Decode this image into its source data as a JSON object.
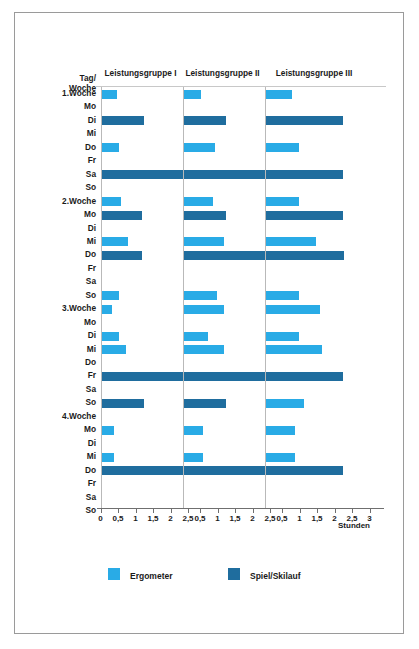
{
  "corner_label": "Tag/\nWoche",
  "unit_label": "Stunden",
  "panels": [
    {
      "title": "Leistungsgruppe I",
      "ticks": [
        "0",
        "0,5",
        "1",
        "1,5",
        "2",
        "2,5"
      ],
      "tick_values": [
        0,
        0.5,
        1,
        1.5,
        2,
        2.5
      ]
    },
    {
      "title": "Leistungsgruppe II",
      "ticks": [
        "0,5",
        "1",
        "1,5",
        "2",
        "2,5"
      ],
      "tick_values": [
        0.5,
        1,
        1.5,
        2,
        2.5
      ]
    },
    {
      "title": "Leistungsgruppe III",
      "ticks": [
        "0,5",
        "1",
        "1,5",
        "2",
        "2,5",
        "3"
      ],
      "tick_values": [
        0.5,
        1,
        1.5,
        2,
        2.5,
        3
      ]
    }
  ],
  "legend": [
    {
      "label": "Ergometer",
      "color": "#29abe6",
      "series": "ergometer"
    },
    {
      "label": "Spiel/Skilauf",
      "color": "#1f6d9e",
      "series": "spiel"
    }
  ],
  "rows": [
    {
      "label": "1.Woche",
      "type": "week"
    },
    {
      "label": "Mo",
      "type": "day"
    },
    {
      "label": "Di",
      "type": "day"
    },
    {
      "label": "Mi",
      "type": "day"
    },
    {
      "label": "Do",
      "type": "day"
    },
    {
      "label": "Fr",
      "type": "day"
    },
    {
      "label": "Sa",
      "type": "day"
    },
    {
      "label": "So",
      "type": "day"
    },
    {
      "label": "2.Woche",
      "type": "week"
    },
    {
      "label": "Mo",
      "type": "day"
    },
    {
      "label": "Di",
      "type": "day"
    },
    {
      "label": "Mi",
      "type": "day"
    },
    {
      "label": "Do",
      "type": "day"
    },
    {
      "label": "Fr",
      "type": "day"
    },
    {
      "label": "Sa",
      "type": "day"
    },
    {
      "label": "So",
      "type": "day"
    },
    {
      "label": "3.Woche",
      "type": "week"
    },
    {
      "label": "Mo",
      "type": "day"
    },
    {
      "label": "Di",
      "type": "day"
    },
    {
      "label": "Mi",
      "type": "day"
    },
    {
      "label": "Do",
      "type": "day"
    },
    {
      "label": "Fr",
      "type": "day"
    },
    {
      "label": "Sa",
      "type": "day"
    },
    {
      "label": "So",
      "type": "day"
    },
    {
      "label": "4.Woche",
      "type": "week"
    },
    {
      "label": "Mo",
      "type": "day"
    },
    {
      "label": "Di",
      "type": "day"
    },
    {
      "label": "Mi",
      "type": "day"
    },
    {
      "label": "Do",
      "type": "day"
    },
    {
      "label": "Fr",
      "type": "day"
    },
    {
      "label": "Sa",
      "type": "day"
    },
    {
      "label": "So",
      "type": "day"
    }
  ],
  "chart_data": {
    "type": "bar",
    "orientation": "horizontal",
    "title": "",
    "xlabel": "Stunden",
    "ylabel": "Tag/Woche",
    "grid": false,
    "legend_position": "bottom",
    "categories": [
      "1.Woche Mo",
      "1.Woche Di",
      "1.Woche Mi",
      "1.Woche Do",
      "1.Woche Fr",
      "1.Woche Sa",
      "1.Woche So",
      "2.Woche Mo",
      "2.Woche Di",
      "2.Woche Mi",
      "2.Woche Do",
      "2.Woche Fr",
      "2.Woche Sa",
      "2.Woche So",
      "3.Woche Mo",
      "3.Woche Di",
      "3.Woche Mi",
      "3.Woche Do",
      "3.Woche Fr",
      "3.Woche Sa",
      "3.Woche So",
      "4.Woche Mo",
      "4.Woche Di",
      "4.Woche Mi",
      "4.Woche Do",
      "4.Woche Fr",
      "4.Woche Sa",
      "4.Woche So"
    ],
    "panel_names": [
      "Leistungsgruppe I",
      "Leistungsgruppe II",
      "Leistungsgruppe III"
    ],
    "series_names": [
      "Ergometer",
      "Spiel/Skilauf"
    ],
    "colors": {
      "ergometer": "#29abe6",
      "spiel": "#1f6d9e"
    },
    "xlim": [
      0,
      3
    ],
    "panels": [
      {
        "name": "Leistungsgruppe I",
        "xlim": [
          0,
          2.5
        ],
        "bars": [
          {
            "slot": 0,
            "series": "ergometer",
            "value": 0.45
          },
          {
            "slot": 1,
            "series": null,
            "value": 0
          },
          {
            "slot": 2,
            "series": "spiel",
            "value": 1.2
          },
          {
            "slot": 3,
            "series": null,
            "value": 0
          },
          {
            "slot": 4,
            "series": "ergometer",
            "value": 0.5
          },
          {
            "slot": 5,
            "series": null,
            "value": 0
          },
          {
            "slot": 6,
            "series": "spiel",
            "value": 2.35
          },
          {
            "slot": 7,
            "series": null,
            "value": 0
          },
          {
            "slot": 8,
            "series": "ergometer",
            "value": 0.55
          },
          {
            "slot": 9,
            "series": "spiel",
            "value": 1.15
          },
          {
            "slot": 10,
            "series": null,
            "value": 0
          },
          {
            "slot": 11,
            "series": "ergometer",
            "value": 0.75
          },
          {
            "slot": 12,
            "series": "spiel",
            "value": 1.15
          },
          {
            "slot": 13,
            "series": null,
            "value": 0
          },
          {
            "slot": 14,
            "series": null,
            "value": 0
          },
          {
            "slot": 15,
            "series": "ergometer",
            "value": 0.5
          },
          {
            "slot": 16,
            "series": "ergometer",
            "value": 0.3
          },
          {
            "slot": 17,
            "series": null,
            "value": 0
          },
          {
            "slot": 18,
            "series": "ergometer",
            "value": 0.5
          },
          {
            "slot": 19,
            "series": "ergometer",
            "value": 0.7
          },
          {
            "slot": 20,
            "series": null,
            "value": 0
          },
          {
            "slot": 21,
            "series": "spiel",
            "value": 2.35
          },
          {
            "slot": 22,
            "series": null,
            "value": 0
          },
          {
            "slot": 23,
            "series": "spiel",
            "value": 1.2
          },
          {
            "slot": 24,
            "series": null,
            "value": 0
          },
          {
            "slot": 25,
            "series": "ergometer",
            "value": 0.35
          },
          {
            "slot": 26,
            "series": null,
            "value": 0
          },
          {
            "slot": 27,
            "series": "ergometer",
            "value": 0.35
          },
          {
            "slot": 28,
            "series": "spiel",
            "value": 2.35
          }
        ]
      },
      {
        "name": "Leistungsgruppe II",
        "xlim": [
          0,
          2.5
        ],
        "bars": [
          {
            "slot": 0,
            "series": "ergometer",
            "value": 0.5
          },
          {
            "slot": 1,
            "series": null,
            "value": 0
          },
          {
            "slot": 2,
            "series": "spiel",
            "value": 1.2
          },
          {
            "slot": 3,
            "series": null,
            "value": 0
          },
          {
            "slot": 4,
            "series": "ergometer",
            "value": 0.9
          },
          {
            "slot": 5,
            "series": null,
            "value": 0
          },
          {
            "slot": 6,
            "series": "spiel",
            "value": 2.45
          },
          {
            "slot": 7,
            "series": null,
            "value": 0
          },
          {
            "slot": 8,
            "series": "ergometer",
            "value": 0.85
          },
          {
            "slot": 9,
            "series": "spiel",
            "value": 1.2
          },
          {
            "slot": 10,
            "series": null,
            "value": 0
          },
          {
            "slot": 11,
            "series": "ergometer",
            "value": 1.15
          },
          {
            "slot": 12,
            "series": "spiel",
            "value": 2.45
          },
          {
            "slot": 13,
            "series": null,
            "value": 0
          },
          {
            "slot": 14,
            "series": null,
            "value": 0
          },
          {
            "slot": 15,
            "series": "ergometer",
            "value": 0.95
          },
          {
            "slot": 16,
            "series": "ergometer",
            "value": 1.15
          },
          {
            "slot": 17,
            "series": null,
            "value": 0
          },
          {
            "slot": 18,
            "series": "ergometer",
            "value": 0.7
          },
          {
            "slot": 19,
            "series": "ergometer",
            "value": 1.15
          },
          {
            "slot": 20,
            "series": null,
            "value": 0
          },
          {
            "slot": 21,
            "series": "spiel",
            "value": 2.4
          },
          {
            "slot": 22,
            "series": null,
            "value": 0
          },
          {
            "slot": 23,
            "series": "spiel",
            "value": 1.2
          },
          {
            "slot": 24,
            "series": null,
            "value": 0
          },
          {
            "slot": 25,
            "series": "ergometer",
            "value": 0.55
          },
          {
            "slot": 26,
            "series": null,
            "value": 0
          },
          {
            "slot": 27,
            "series": "ergometer",
            "value": 0.55
          },
          {
            "slot": 28,
            "series": "spiel",
            "value": 2.4
          }
        ]
      },
      {
        "name": "Leistungsgruppe III",
        "xlim": [
          0,
          3
        ],
        "bars": [
          {
            "slot": 0,
            "series": "ergometer",
            "value": 0.75
          },
          {
            "slot": 1,
            "series": null,
            "value": 0
          },
          {
            "slot": 2,
            "series": "spiel",
            "value": 2.2
          },
          {
            "slot": 3,
            "series": null,
            "value": 0
          },
          {
            "slot": 4,
            "series": "ergometer",
            "value": 0.95
          },
          {
            "slot": 5,
            "series": null,
            "value": 0
          },
          {
            "slot": 6,
            "series": "spiel",
            "value": 2.2
          },
          {
            "slot": 7,
            "series": null,
            "value": 0
          },
          {
            "slot": 8,
            "series": "ergometer",
            "value": 0.95
          },
          {
            "slot": 9,
            "series": "spiel",
            "value": 2.2
          },
          {
            "slot": 10,
            "series": null,
            "value": 0
          },
          {
            "slot": 11,
            "series": "ergometer",
            "value": 1.45
          },
          {
            "slot": 12,
            "series": "spiel",
            "value": 2.25
          },
          {
            "slot": 13,
            "series": null,
            "value": 0
          },
          {
            "slot": 14,
            "series": null,
            "value": 0
          },
          {
            "slot": 15,
            "series": "ergometer",
            "value": 0.95
          },
          {
            "slot": 16,
            "series": "ergometer",
            "value": 1.55
          },
          {
            "slot": 17,
            "series": null,
            "value": 0
          },
          {
            "slot": 18,
            "series": "ergometer",
            "value": 0.95
          },
          {
            "slot": 19,
            "series": "ergometer",
            "value": 1.6
          },
          {
            "slot": 20,
            "series": null,
            "value": 0
          },
          {
            "slot": 21,
            "series": "spiel",
            "value": 2.2
          },
          {
            "slot": 22,
            "series": null,
            "value": 0
          },
          {
            "slot": 23,
            "series": "ergometer",
            "value": 1.1
          },
          {
            "slot": 24,
            "series": null,
            "value": 0
          },
          {
            "slot": 25,
            "series": "ergometer",
            "value": 0.85
          },
          {
            "slot": 26,
            "series": null,
            "value": 0
          },
          {
            "slot": 27,
            "series": "ergometer",
            "value": 0.85
          },
          {
            "slot": 28,
            "series": "spiel",
            "value": 2.2
          }
        ]
      }
    ]
  }
}
